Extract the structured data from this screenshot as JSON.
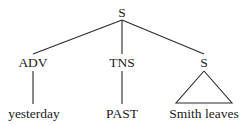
{
  "figure": {
    "kind": "syntax-tree",
    "background_color": "#ffffff",
    "line_color": "#2b2b2b",
    "text_color": "#1a1a1a"
  },
  "tree": {
    "root": {
      "label": "S",
      "x": 122,
      "y": 17
    },
    "level2": [
      {
        "label": "ADV",
        "x": 33,
        "y": 67
      },
      {
        "label": "TNS",
        "x": 122,
        "y": 67
      },
      {
        "label": "S",
        "x": 204,
        "y": 67
      }
    ],
    "leaves": [
      {
        "label": "yesterday",
        "x": 34,
        "y": 118
      },
      {
        "label": "PAST",
        "x": 122,
        "y": 118
      },
      {
        "label": "Smith leaves",
        "x": 204,
        "y": 118
      }
    ],
    "edges": [
      {
        "name": "root-to-adv",
        "x1": 122,
        "y1": 20,
        "x2": 33,
        "y2": 54
      },
      {
        "name": "root-to-tns",
        "x1": 122,
        "y1": 20,
        "x2": 122,
        "y2": 54
      },
      {
        "name": "root-to-s2",
        "x1": 122,
        "y1": 20,
        "x2": 204,
        "y2": 54
      },
      {
        "name": "adv-to-yesterday",
        "x1": 33,
        "y1": 71,
        "x2": 33,
        "y2": 104
      },
      {
        "name": "tns-to-past",
        "x1": 122,
        "y1": 71,
        "x2": 122,
        "y2": 104
      }
    ],
    "triangle": {
      "name": "s2-triangle",
      "apex_x": 204,
      "apex_y": 71,
      "left_x": 176,
      "base_y": 103,
      "right_x": 232,
      "points": "204,71 176,103 232,103 204,71"
    }
  }
}
